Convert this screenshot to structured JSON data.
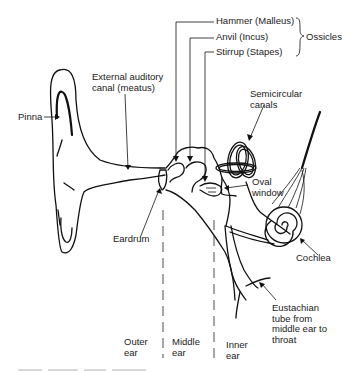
{
  "figure": {
    "labels": {
      "hammer": "Hammer (Malleus)",
      "anvil": "Anvil (Incus)",
      "stirrup": "Stirrup (Stapes)",
      "ossicles": "Ossicles",
      "external_canal": "External auditory\ncanal (meatus)",
      "pinna": "Pinna",
      "semicircular": "Semicircular\ncanals",
      "oval_window": "Oval\nwindow",
      "eardrum": "Eardrum",
      "cochlea": "Cochlea",
      "eustachian": "Eustachian\ntube from\nmiddle ear to\nthroat"
    },
    "regions": {
      "outer": "Outer\near",
      "middle": "Middle\near",
      "inner": "Inner\near"
    },
    "caption_note": "caption text cut off / illegible at bottom edge"
  }
}
